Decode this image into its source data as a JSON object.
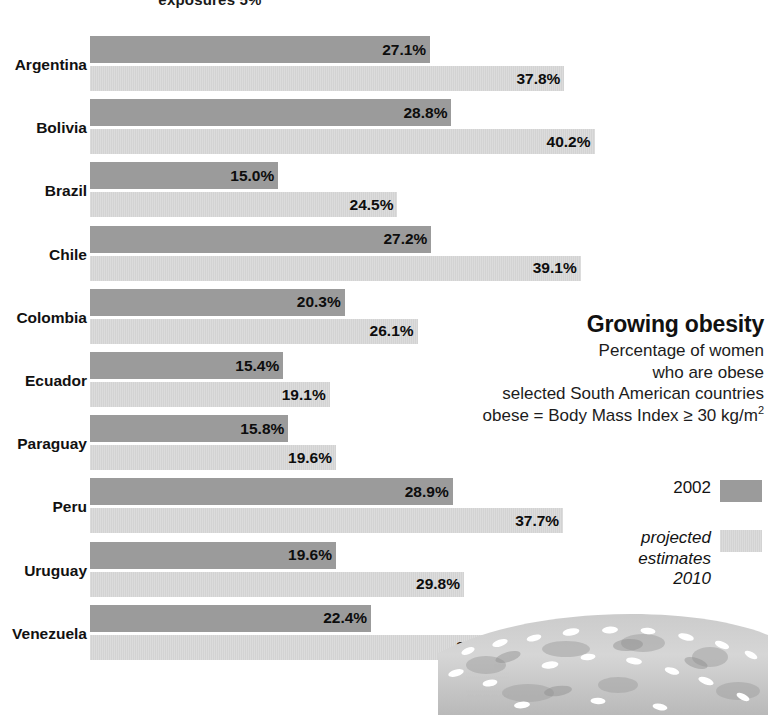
{
  "top_cropped_title": "exposures 5%",
  "caption": {
    "title": "Growing obesity",
    "lines": [
      "Percentage of women",
      "who are obese",
      "selected South American countries"
    ],
    "definition_prefix": "obese = Body Mass Index ≥ 30 kg/m",
    "definition_exponent": "2"
  },
  "legend": {
    "items": [
      {
        "label": "2002",
        "swatch": "dark-gray-swatch",
        "italic": false
      },
      {
        "label": "projected\nestimates\n2010",
        "swatch": "light-gray-swatch",
        "italic": true
      }
    ],
    "series_2002_label": "2002",
    "series_2010_label_line1": "projected",
    "series_2010_label_line2": "estimates",
    "series_2010_label_line3": "2010"
  },
  "colors": {
    "bar_2002": "#9b9b9b",
    "bar_2010": "#dcdcdc",
    "text": "#111111",
    "background": "#ffffff"
  },
  "chart_data": {
    "type": "bar",
    "orientation": "horizontal",
    "title": "Growing obesity",
    "subtitle": "Percentage of women who are obese, selected South American countries",
    "note": "obese = Body Mass Index ≥ 30 kg/m2",
    "xlabel": "",
    "ylabel": "",
    "xlim": [
      0,
      42
    ],
    "grid": false,
    "legend_position": "right",
    "value_suffix": "%",
    "categories": [
      "Argentina",
      "Bolivia",
      "Brazil",
      "Chile",
      "Colombia",
      "Ecuador",
      "Paraguay",
      "Peru",
      "Uruguay",
      "Venezuela"
    ],
    "series": [
      {
        "name": "2002",
        "values": [
          27.1,
          28.8,
          15.0,
          27.2,
          20.3,
          15.4,
          15.8,
          28.9,
          19.6,
          22.4
        ],
        "labels": [
          "27.1%",
          "28.8%",
          "15.0%",
          "27.2%",
          "20.3%",
          "15.4%",
          "15.8%",
          "28.9%",
          "19.6%",
          "22.4%"
        ]
      },
      {
        "name": "projected estimates 2010",
        "values": [
          37.8,
          40.2,
          24.5,
          39.1,
          26.1,
          19.1,
          19.6,
          37.7,
          29.8,
          33.0
        ],
        "labels": [
          "37.8%",
          "40.2%",
          "24.5%",
          "39.1%",
          "26.1%",
          "19.1%",
          "19.6%",
          "37.7%",
          "29.8%",
          "33.0%"
        ]
      }
    ]
  }
}
